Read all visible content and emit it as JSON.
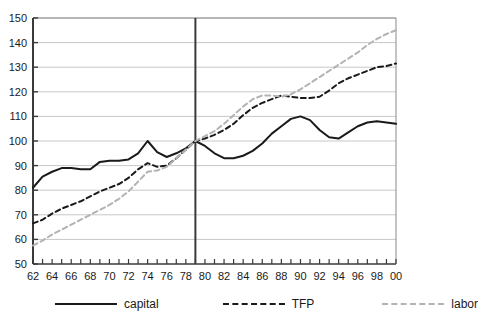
{
  "chart_data": {
    "type": "line",
    "title": "",
    "xlabel": "",
    "ylabel": "",
    "ylim": [
      50,
      150
    ],
    "xlim": [
      62,
      100
    ],
    "grid": true,
    "legend_position": "bottom",
    "y_ticks": [
      50,
      60,
      70,
      80,
      90,
      100,
      110,
      120,
      130,
      140,
      150
    ],
    "x_tick_labels": [
      "62",
      "64",
      "66",
      "68",
      "70",
      "72",
      "74",
      "76",
      "78",
      "80",
      "82",
      "84",
      "86",
      "88",
      "90",
      "92",
      "94",
      "96",
      "98",
      "00"
    ],
    "x_minor_ticks_every": 1,
    "annotations": [
      {
        "type": "vline",
        "x": 79,
        "label": "",
        "color": "#3a3a3a"
      }
    ],
    "x": [
      62,
      63,
      64,
      65,
      66,
      67,
      68,
      69,
      70,
      71,
      72,
      73,
      74,
      75,
      76,
      77,
      78,
      79,
      80,
      81,
      82,
      83,
      84,
      85,
      86,
      87,
      88,
      89,
      90,
      91,
      92,
      93,
      94,
      95,
      96,
      97,
      98,
      99,
      100
    ],
    "series": [
      {
        "name": "capital",
        "style": "solid",
        "color": "#1a1a1a",
        "values": [
          81,
          85.5,
          87.5,
          89,
          89,
          88.5,
          88.5,
          91.5,
          92,
          92,
          92.5,
          95,
          100,
          95.5,
          93.5,
          95,
          97,
          100,
          98,
          95,
          93,
          93,
          94,
          96,
          99,
          103,
          106,
          109,
          110,
          108.5,
          104.5,
          101.5,
          101,
          103.5,
          106,
          107.5,
          108,
          107.5,
          107
        ]
      },
      {
        "name": "TFP",
        "style": "dashed",
        "color": "#1a1a1a",
        "values": [
          66.5,
          68,
          70.5,
          72.5,
          74,
          75.5,
          77.5,
          79.5,
          81,
          82.5,
          85,
          88.5,
          91,
          89.5,
          90,
          93,
          96.5,
          100,
          101,
          102.5,
          104.5,
          107,
          110.5,
          113.5,
          115.5,
          117,
          118.5,
          118,
          117.5,
          117.5,
          118,
          120.5,
          123.5,
          125.5,
          127,
          128.5,
          130,
          130.5,
          131.5
        ]
      },
      {
        "name": "labor",
        "style": "dashed",
        "color": "#b3b3b3",
        "values": [
          57.5,
          59.5,
          62,
          64,
          66,
          68,
          70,
          72,
          74,
          76.5,
          79.5,
          83.5,
          87.5,
          88,
          89.5,
          93,
          96.5,
          100,
          102,
          104,
          107,
          110.5,
          114,
          117,
          118.5,
          118.5,
          118,
          119,
          121,
          123.5,
          126,
          128.5,
          131,
          133.5,
          136,
          139,
          141.5,
          143.5,
          145
        ]
      }
    ]
  },
  "legend": {
    "items": [
      {
        "label": "capital",
        "swatch": "solid-line-swatch"
      },
      {
        "label": "TFP",
        "swatch": "dashed-dark-line-swatch"
      },
      {
        "label": "labor",
        "swatch": "dashed-light-line-swatch"
      }
    ]
  }
}
